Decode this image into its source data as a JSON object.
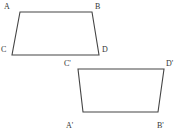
{
  "figure": {
    "background_color": "#ffffff",
    "stroke_color": "#444444",
    "label_color": "#333333",
    "stroke_width": 1.1,
    "width": 182,
    "height": 137
  },
  "shapes": [
    {
      "name": "quadrilateral-abcd",
      "label": "ABCD",
      "vertices": [
        {
          "label": "A",
          "x": 20,
          "y": 12
        },
        {
          "label": "B",
          "x": 92,
          "y": 12
        },
        {
          "label": "D",
          "x": 99,
          "y": 55
        },
        {
          "label": "C",
          "x": 12,
          "y": 55
        }
      ],
      "points_attr": "20,12 92,12 99,55 12,55"
    },
    {
      "name": "quadrilateral-a-prime-b-prime-c-prime-d-prime",
      "label": "A'B'C'D'",
      "vertices": [
        {
          "label": "C'",
          "x": 78,
          "y": 69
        },
        {
          "label": "D'",
          "x": 164,
          "y": 69
        },
        {
          "label": "B'",
          "x": 158,
          "y": 112
        },
        {
          "label": "A'",
          "x": 83,
          "y": 112
        }
      ],
      "points_attr": "78,69 164,69 158,112 83,112"
    }
  ],
  "labels": [
    {
      "key": "a",
      "text": "A",
      "left": 4,
      "top": 2
    },
    {
      "key": "b",
      "text": "B",
      "left": 95,
      "top": 2
    },
    {
      "key": "c",
      "text": "C",
      "left": 1,
      "top": 45
    },
    {
      "key": "d",
      "text": "D",
      "left": 102,
      "top": 45
    },
    {
      "key": "cp",
      "text": "C'",
      "left": 64,
      "top": 59
    },
    {
      "key": "dp",
      "text": "D'",
      "left": 166,
      "top": 59
    },
    {
      "key": "ap",
      "text": "A'",
      "left": 66,
      "top": 121
    },
    {
      "key": "bp",
      "text": "B'",
      "left": 157,
      "top": 121
    }
  ]
}
